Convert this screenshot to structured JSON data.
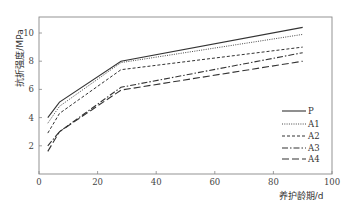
{
  "chart_data": {
    "type": "line",
    "title": "",
    "xlabel": "养护龄期/d",
    "ylabel": "抗折强度/MPa",
    "xlim": [
      0,
      100
    ],
    "ylim": [
      0,
      11
    ],
    "xticks": [
      0,
      20,
      40,
      60,
      80,
      100
    ],
    "yticks": [
      2,
      4,
      6,
      8,
      10
    ],
    "grid": false,
    "legend_position": "lower right",
    "x": [
      3,
      7,
      28,
      90
    ],
    "series": [
      {
        "name": "P",
        "style": "solid",
        "values": [
          4.0,
          5.1,
          8.0,
          10.4
        ]
      },
      {
        "name": "A1",
        "style": "dotted",
        "values": [
          3.6,
          4.8,
          7.9,
          9.9
        ]
      },
      {
        "name": "A2",
        "style": "dashed",
        "values": [
          2.9,
          4.3,
          7.4,
          9.0
        ]
      },
      {
        "name": "A3",
        "style": "dash-dot",
        "values": [
          2.0,
          3.0,
          6.15,
          8.6
        ]
      },
      {
        "name": "A4",
        "style": "long-dash",
        "values": [
          1.6,
          3.0,
          5.95,
          8.0
        ]
      }
    ]
  },
  "colors": {
    "line": "#333333",
    "frame": "#888888"
  }
}
